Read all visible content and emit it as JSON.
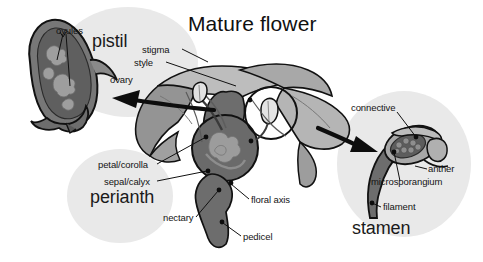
{
  "figure": {
    "title": "Mature flower",
    "kind": "botanical-diagram",
    "palette": {
      "background": "#ffffff",
      "tint_circle": "#e9e9e9",
      "petal_light": "#bdbdbd",
      "sepal_mid": "#949494",
      "axis_dark": "#6d6d6d",
      "ovary_dark": "#5f5f5f",
      "ovule_light": "#9a9a9a",
      "outline": "#111111",
      "text": "#141414"
    }
  },
  "groups": [
    {
      "id": "pistil",
      "label": "pistil"
    },
    {
      "id": "perianth",
      "label": "perianth"
    },
    {
      "id": "stamen",
      "label": "stamen"
    }
  ],
  "labels": [
    {
      "id": "ovules",
      "text": "ovules"
    },
    {
      "id": "stigma",
      "text": "stigma"
    },
    {
      "id": "style",
      "text": "style"
    },
    {
      "id": "ovary",
      "text": "ovary"
    },
    {
      "id": "petal-corolla",
      "text": "petal/corolla"
    },
    {
      "id": "sepal-calyx",
      "text": "sepal/calyx"
    },
    {
      "id": "nectary",
      "text": "nectary"
    },
    {
      "id": "floral-axis",
      "text": "floral axis"
    },
    {
      "id": "pedicel",
      "text": "pedicel"
    },
    {
      "id": "connective",
      "text": "connective"
    },
    {
      "id": "anther",
      "text": "anther"
    },
    {
      "id": "microsporangium",
      "text": "microsporangium"
    },
    {
      "id": "filament",
      "text": "filament"
    }
  ]
}
